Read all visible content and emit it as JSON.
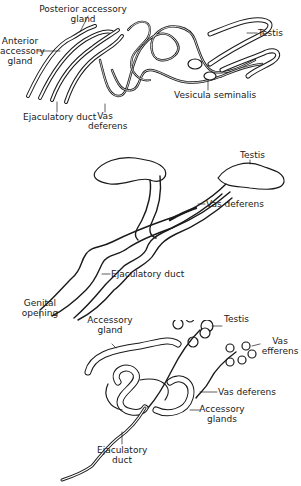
{
  "figures": [
    {
      "id": "a",
      "labels": {
        "posterior_accessory_gland_1": "Posterior accessory",
        "posterior_accessory_gland_2": "gland",
        "anterior_accessory_gland_1": "Anterior",
        "anterior_accessory_gland_2": "accessory",
        "anterior_accessory_gland_3": "gland",
        "testis": "Testis",
        "ejaculatory_duct": "Ejaculatory duct",
        "vas_deferens_1": "Vas",
        "vas_deferens_2": "deferens",
        "vesicula_seminalis": "Vesicula seminalis"
      }
    },
    {
      "id": "b",
      "labels": {
        "testis": "Testis",
        "vas_deferens": "Vas deferens",
        "ejaculatory_duct": "Ejaculatory duct",
        "genital_opening_1": "Genital",
        "genital_opening_2": "opening"
      }
    },
    {
      "id": "c",
      "labels": {
        "accessory_gland_1": "Accessory",
        "accessory_gland_2": "gland",
        "testis": "Testis",
        "vas_efferens_1": "Vas",
        "vas_efferens_2": "efferens",
        "vas_deferens": "Vas deferens",
        "accessory_glands_1": "Accessory",
        "accessory_glands_2": "glands",
        "ejaculatory_duct_1": "Ejaculatory",
        "ejaculatory_duct_2": "duct"
      }
    }
  ],
  "colors": {
    "ink": "#1a1a1a",
    "paper": "#ffffff"
  }
}
